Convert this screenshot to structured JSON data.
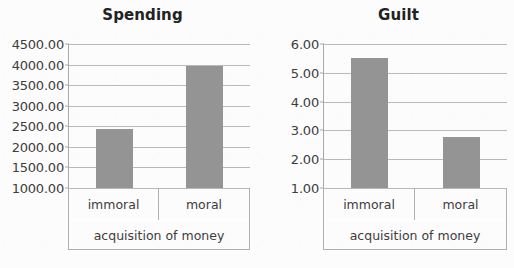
{
  "figure": {
    "background_color": "#fcfcfc",
    "bar_color": "#949494",
    "gridline_color": "#b9b9b9",
    "axis_color": "#a8a8a8",
    "text_color": "#3d3d3d"
  },
  "chart_data": [
    {
      "type": "bar",
      "title": "Spending",
      "xlabel": "acquisition of money",
      "ylabel": "",
      "categories": [
        "immoral",
        "moral"
      ],
      "values": [
        2440.0,
        3960.0
      ],
      "ylim": [
        1000.0,
        4500.0
      ],
      "ytick_values": [
        4500.0,
        4000.0,
        3500.0,
        3000.0,
        2500.0,
        2000.0,
        1500.0,
        1000.0
      ],
      "ytick_labels": [
        "4500.00",
        "4000.00",
        "3500.00",
        "3000.00",
        "2500.00",
        "2000.00",
        "1500.00",
        "1000.00"
      ],
      "grid": true,
      "legend": false
    },
    {
      "type": "bar",
      "title": "Guilt",
      "xlabel": "acquisition of money",
      "ylabel": "",
      "categories": [
        "immoral",
        "moral"
      ],
      "values": [
        5.52,
        2.76
      ],
      "ylim": [
        1.0,
        6.0
      ],
      "ytick_values": [
        6.0,
        5.0,
        4.0,
        3.0,
        2.0,
        1.0
      ],
      "ytick_labels": [
        "6.00",
        "5.00",
        "4.00",
        "3.00",
        "2.00",
        "1.00"
      ],
      "grid": true,
      "legend": false
    }
  ]
}
